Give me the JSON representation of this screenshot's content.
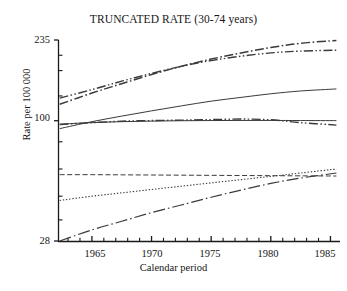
{
  "chart_data": {
    "type": "line",
    "title": "TRUNCATED RATE (30-74 years)",
    "xlabel": "Calendar period",
    "ylabel": "Rate per 100 000",
    "scale": "log-y",
    "grid": false,
    "legend": "none",
    "xlim": [
      1962.2,
      1985.8
    ],
    "ylim": [
      28,
      235
    ],
    "xticks_major": [
      1965,
      1970,
      1975,
      1980,
      1985
    ],
    "xtick_labels": [
      "1965",
      "1970",
      "1975",
      "1980",
      "1985"
    ],
    "xticks_minor": [
      1963,
      1964,
      1966,
      1967,
      1968,
      1969,
      1971,
      1972,
      1973,
      1974,
      1976,
      1977,
      1978,
      1979,
      1981,
      1982,
      1983,
      1984
    ],
    "yticks_major": [
      28,
      100,
      235
    ],
    "ytick_labels": [
      "28",
      "100",
      "235"
    ],
    "yticks_minor": [
      35,
      45,
      60,
      80,
      130,
      170,
      200
    ],
    "x": [
      1962.3,
      1965,
      1967.5,
      1970,
      1972.5,
      1975,
      1977.5,
      1980,
      1982.5,
      1985.5
    ],
    "series": [
      {
        "name": "series-1",
        "style": "dash-dot",
        "values": [
          119,
          134,
          148,
          163,
          178,
          192,
          205,
          217,
          227,
          234
        ]
      },
      {
        "name": "series-2",
        "style": "dash-dot-dot",
        "values": [
          127,
          139,
          152,
          165,
          178,
          189,
          198,
          205,
          209,
          211
        ]
      },
      {
        "name": "series-3",
        "style": "solid-rising",
        "values": [
          92,
          99,
          105,
          111,
          117,
          123,
          128,
          133,
          137,
          140
        ]
      },
      {
        "name": "series-4",
        "style": "solid-flat",
        "values": [
          96.5,
          98,
          99,
          99.6,
          100,
          100.2,
          100.3,
          100.3,
          100.2,
          100.1
        ]
      },
      {
        "name": "series-5",
        "style": "dash-dot-dot-falling",
        "values": [
          96,
          98,
          99.5,
          100.2,
          100.6,
          101.2,
          101.8,
          101,
          98,
          95.5
        ]
      },
      {
        "name": "series-6",
        "style": "dashed-flat",
        "values": [
          56.5,
          56.5,
          56.4,
          56.3,
          56.2,
          56.1,
          56,
          55.9,
          55.8,
          55.7
        ]
      },
      {
        "name": "series-7",
        "style": "dotted-rising",
        "values": [
          43,
          45,
          46.6,
          48.3,
          50,
          51.8,
          53.6,
          55.5,
          57.5,
          60
        ]
      },
      {
        "name": "series-8",
        "style": "long-dash-dot-rising",
        "values": [
          28,
          31.5,
          34.5,
          37.8,
          41,
          44.5,
          48,
          51.5,
          54.5,
          57.5
        ]
      }
    ]
  },
  "axis": {
    "title": "TRUNCATED RATE (30-74 years)",
    "ylabel": "Rate per 100 000",
    "xlabel": "Calendar period",
    "ytick_0": "235",
    "ytick_1": "100",
    "ytick_2": "28",
    "xtick_0": "1965",
    "xtick_1": "1970",
    "xtick_2": "1975",
    "xtick_3": "1980",
    "xtick_4": "1985"
  },
  "colors": {
    "axis": "#1a1a1a",
    "line": "#3a3a3a",
    "background": "#ffffff"
  }
}
